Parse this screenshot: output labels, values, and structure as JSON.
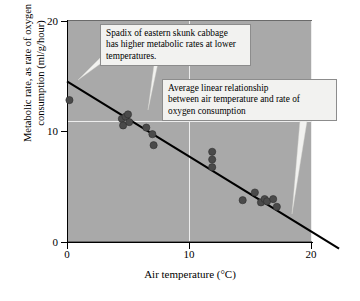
{
  "chart_data": {
    "type": "scatter",
    "title": "",
    "xlabel": "Air temperature (°C)",
    "ylabel": "Metabolic rate, as rate of oxygen consumption (ml/g/hour)",
    "ylabel_line1": "Metabolic rate, as rate of oxygen",
    "ylabel_line2": "consumption (ml/g/hour)",
    "xlim": [
      0,
      22.3
    ],
    "ylim": [
      0,
      20
    ],
    "xticks": [
      0,
      10,
      20
    ],
    "xticklabels": [
      "0",
      "10",
      "20"
    ],
    "yticks": [
      0,
      10,
      20
    ],
    "yticklabels": [
      "0",
      "10",
      "20"
    ],
    "grid": true,
    "gridlines_x": [
      10,
      20
    ],
    "gridlines_y": [
      10
    ],
    "legend": "none",
    "series": [
      {
        "name": "Spadix metabolic rate measurements",
        "marker": "filled-circle",
        "color": "#4a4a4a",
        "points": [
          {
            "x": 0.2,
            "y": 12.9
          },
          {
            "x": 4.5,
            "y": 11.2
          },
          {
            "x": 4.6,
            "y": 10.6
          },
          {
            "x": 4.8,
            "y": 11.4
          },
          {
            "x": 5.0,
            "y": 11.6
          },
          {
            "x": 5.1,
            "y": 10.9
          },
          {
            "x": 6.5,
            "y": 10.4
          },
          {
            "x": 7.0,
            "y": 9.8
          },
          {
            "x": 7.1,
            "y": 8.8
          },
          {
            "x": 11.9,
            "y": 8.2
          },
          {
            "x": 11.9,
            "y": 7.5
          },
          {
            "x": 11.9,
            "y": 6.8
          },
          {
            "x": 14.4,
            "y": 3.8
          },
          {
            "x": 15.4,
            "y": 4.5
          },
          {
            "x": 15.9,
            "y": 3.6
          },
          {
            "x": 16.2,
            "y": 3.9
          },
          {
            "x": 16.4,
            "y": 3.7
          },
          {
            "x": 16.9,
            "y": 3.9
          },
          {
            "x": 17.2,
            "y": 3.2
          }
        ]
      }
    ],
    "fit_line": {
      "name": "Average linear relationship",
      "color": "#000000",
      "x_start": 0,
      "y_start": 14.6,
      "x_end": 22.3,
      "y_end": -0.6
    },
    "annotations": [
      {
        "id": "callout-1",
        "text": "Spadix of eastern skunk cabbage has higher metabolic rates at lower temperatures.",
        "line1": "Spadix of eastern skunk cabbage",
        "line2": "has higher metabolic rates at lower",
        "line3": "temperatures.",
        "points_to": [
          "regression-line",
          "data-cluster"
        ]
      },
      {
        "id": "callout-2",
        "text": "Average linear relationship between air temperature and rate of oxygen consumption",
        "line1": "Average linear relationship",
        "line2": "between air temperature and rate of",
        "line3": "oxygen consumption",
        "points_to": [
          "regression-line"
        ]
      }
    ],
    "colors": {
      "plot_background": "#a9a9a9",
      "gridline": "#ededed",
      "marker": "#4a4a4a",
      "fit_line": "#000000",
      "callout_background": "#f2f2f0",
      "callout_border": "#8c8c8c",
      "page_background": "#ffffff"
    }
  }
}
